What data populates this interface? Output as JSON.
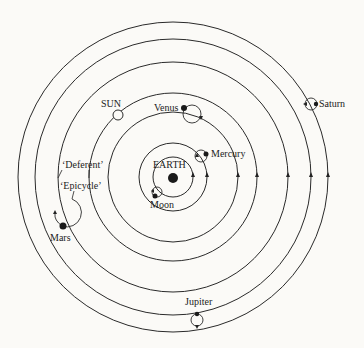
{
  "labels": {
    "earth": "EARTH",
    "moon": "Moon",
    "mercury": "Mercury",
    "venus": "Venus",
    "sun": "SUN",
    "mars": "Mars",
    "jupiter": "Jupiter",
    "saturn": "Saturn",
    "deferent": "‘Deferent’",
    "epicycle": "‘Epicycle’"
  },
  "orbit_order": [
    "Moon",
    "Mercury",
    "Venus",
    "Sun",
    "Mars",
    "Jupiter",
    "Saturn"
  ],
  "colors": {
    "ink": "#2a2a2a",
    "background": "#fbfaf7"
  }
}
